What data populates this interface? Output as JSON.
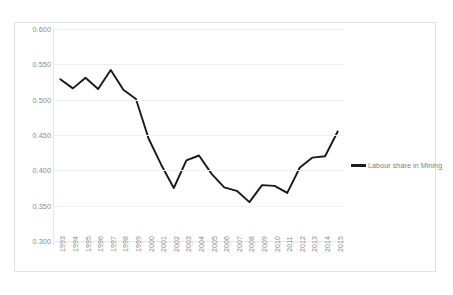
{
  "chart_data": {
    "type": "line",
    "title": "",
    "xlabel": "",
    "ylabel": "",
    "ylim": [
      0.3,
      0.6
    ],
    "ytick_values": [
      0.6,
      0.55,
      0.5,
      0.45,
      0.4,
      0.35,
      0.3
    ],
    "ytick_labels": [
      "0.600",
      "0.550",
      "0.500",
      "0.450",
      "0.400",
      "0.350",
      "0.300"
    ],
    "grid": true,
    "legend_position": "right",
    "categories": [
      "1993",
      "1994",
      "1995",
      "1996",
      "1997",
      "1998",
      "1999",
      "2000",
      "2001",
      "2002",
      "2003",
      "2004",
      "2005",
      "2006",
      "2007",
      "2008",
      "2009",
      "2010",
      "2011",
      "2012",
      "2013",
      "2014",
      "2015"
    ],
    "series": [
      {
        "name": "Labour share in Mining",
        "color": "#1a1a1a",
        "values": [
          0.529,
          0.516,
          0.531,
          0.515,
          0.542,
          0.514,
          0.501,
          0.445,
          0.408,
          0.375,
          0.414,
          0.421,
          0.395,
          0.376,
          0.371,
          0.355,
          0.379,
          0.378,
          0.368,
          0.404,
          0.418,
          0.42,
          0.455
        ]
      }
    ]
  },
  "legend": {
    "entries": [
      {
        "label": "Labour share in Mining"
      }
    ]
  }
}
